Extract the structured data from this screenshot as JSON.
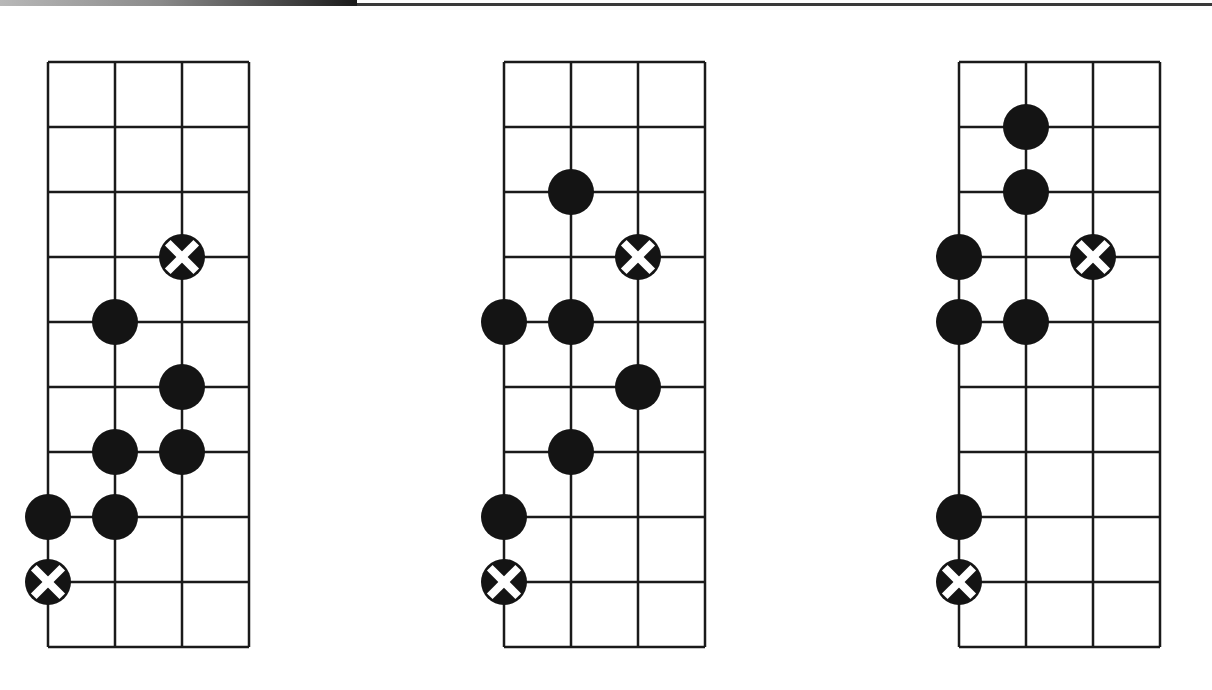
{
  "header": {
    "band_colors": [
      "#b8b8b8",
      "#1a1a1a"
    ]
  },
  "colors": {
    "grid": "#1a1a1a",
    "dot": "#141414",
    "root_marker_fill": "#141414",
    "root_marker_cross": "#ffffff",
    "background": "#ffffff"
  },
  "layout": {
    "columns": 3,
    "rows": 9,
    "cell_width": 67,
    "cell_height": 65,
    "dot_diameter": 46
  },
  "diagrams": [
    {
      "id": "pattern-1",
      "origin": [
        48,
        62
      ],
      "dots": [
        {
          "col": 1,
          "line": 4
        },
        {
          "col": 2,
          "line": 5
        },
        {
          "col": 1,
          "line": 6
        },
        {
          "col": 2,
          "line": 6
        },
        {
          "col": 0,
          "line": 7
        },
        {
          "col": 1,
          "line": 7
        }
      ],
      "roots": [
        {
          "col": 2,
          "line": 3
        },
        {
          "col": 0,
          "line": 8
        }
      ]
    },
    {
      "id": "pattern-2",
      "origin": [
        504,
        62
      ],
      "dots": [
        {
          "col": 1,
          "line": 2
        },
        {
          "col": 0,
          "line": 4
        },
        {
          "col": 1,
          "line": 4
        },
        {
          "col": 2,
          "line": 5
        },
        {
          "col": 1,
          "line": 6
        },
        {
          "col": 0,
          "line": 7
        }
      ],
      "roots": [
        {
          "col": 2,
          "line": 3
        },
        {
          "col": 0,
          "line": 8
        }
      ]
    },
    {
      "id": "pattern-3",
      "origin": [
        959,
        62
      ],
      "dots": [
        {
          "col": 1,
          "line": 1
        },
        {
          "col": 1,
          "line": 2
        },
        {
          "col": 0,
          "line": 3
        },
        {
          "col": 0,
          "line": 4
        },
        {
          "col": 1,
          "line": 4
        },
        {
          "col": 0,
          "line": 7
        }
      ],
      "roots": [
        {
          "col": 2,
          "line": 3
        },
        {
          "col": 0,
          "line": 8
        }
      ]
    }
  ]
}
